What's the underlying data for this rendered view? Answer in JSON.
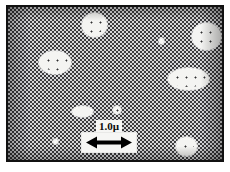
{
  "figure": {
    "kind": "micrograph",
    "caption_visible": false,
    "frame": {
      "border_color": "#111111",
      "border_width_px": 2,
      "margin_px": 5,
      "width_px": 218,
      "height_px": 157
    },
    "matrix": {
      "name": "dithered-gray-matrix",
      "description": "halftone checkerboard dither texture filling the field of view",
      "light_color": "#d6d6d8",
      "dark_color": "#3a3a3c",
      "checker_size_px": 2
    }
  },
  "scale_bar": {
    "label": "1.0µ",
    "value": 1.0,
    "unit": "µ",
    "unit_name": "micron",
    "arrow": "double-headed",
    "arrow_color": "#000000",
    "box_fill": "#f6f6f4",
    "left_px": 73,
    "top_px": 113,
    "width_px": 56,
    "bar_length_px": 46
  },
  "particles": {
    "fill_color": "#f4f4f2",
    "stipple_color": "#2f2f31",
    "count": 9,
    "items": [
      {
        "name": "particle-top-center",
        "shape": "circle",
        "left": 74,
        "top": 6,
        "width": 25,
        "height": 24,
        "size": "medium"
      },
      {
        "name": "particle-top-right",
        "shape": "circle",
        "left": 184,
        "top": 16,
        "width": 29,
        "height": 27,
        "size": "large"
      },
      {
        "name": "particle-mid-left",
        "shape": "ellipse",
        "left": 31,
        "top": 44,
        "width": 32,
        "height": 23,
        "size": "large"
      },
      {
        "name": "particle-mid-right",
        "shape": "ellipse",
        "left": 160,
        "top": 61,
        "width": 41,
        "height": 22,
        "size": "large"
      },
      {
        "name": "particle-center-small",
        "shape": "ellipse",
        "left": 64,
        "top": 99,
        "width": 21,
        "height": 11,
        "size": "small"
      },
      {
        "name": "particle-center-tiny",
        "shape": "circle",
        "left": 105,
        "top": 99,
        "width": 8,
        "height": 8,
        "size": "tiny"
      },
      {
        "name": "particle-bottom-right",
        "shape": "circle",
        "left": 168,
        "top": 130,
        "width": 21,
        "height": 19,
        "size": "medium"
      },
      {
        "name": "particle-top-speck",
        "shape": "circle",
        "left": 151,
        "top": 31,
        "width": 5,
        "height": 6,
        "size": "speck"
      },
      {
        "name": "particle-bottom-left-speck",
        "shape": "circle",
        "left": 45,
        "top": 132,
        "width": 5,
        "height": 5,
        "size": "speck"
      }
    ]
  }
}
